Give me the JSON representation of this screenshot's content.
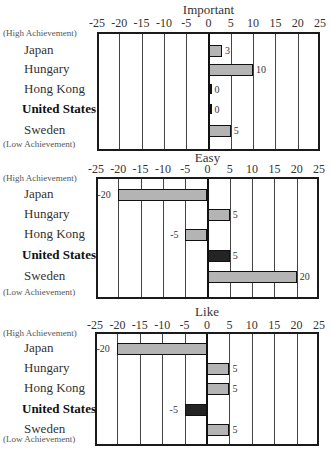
{
  "chart_data": [
    {
      "type": "bar",
      "orientation": "horizontal",
      "title": "Important",
      "categories": [
        "Japan",
        "Hungary",
        "Hong Kong",
        "United States",
        "Sweden"
      ],
      "values": [
        3,
        10,
        0,
        0,
        5
      ],
      "xlim": [
        -25,
        25
      ],
      "xticks": [
        -25,
        -20,
        -15,
        -10,
        -5,
        0,
        5,
        10,
        15,
        20,
        25
      ],
      "grid": true,
      "top_annotation": "(High Achievement)",
      "bottom_annotation": "(Low Achievement)",
      "highlight": "United States"
    },
    {
      "type": "bar",
      "orientation": "horizontal",
      "title": "Easy",
      "categories": [
        "Japan",
        "Hungary",
        "Hong Kong",
        "United States",
        "Sweden"
      ],
      "values": [
        -20,
        5,
        -5,
        5,
        20
      ],
      "xlim": [
        -25,
        25
      ],
      "xticks": [
        -25,
        -20,
        -15,
        -10,
        -5,
        0,
        5,
        10,
        15,
        20,
        25
      ],
      "grid": true,
      "top_annotation": "(High Achievement)",
      "bottom_annotation": "(Low Achievement)",
      "highlight": "United States"
    },
    {
      "type": "bar",
      "orientation": "horizontal",
      "title": "Like",
      "categories": [
        "Japan",
        "Hungary",
        "Hong Kong",
        "United States",
        "Sweden"
      ],
      "values": [
        -20,
        5,
        5,
        -5,
        5
      ],
      "xlim": [
        -25,
        25
      ],
      "xticks": [
        -25,
        -20,
        -15,
        -10,
        -5,
        0,
        5,
        10,
        15,
        20,
        25
      ],
      "grid": true,
      "top_annotation": "(High Achievement)",
      "bottom_annotation": "(Low Achievement)",
      "highlight": "United States"
    }
  ],
  "panels": [
    {
      "title": "Important",
      "high": "(High Achievement)",
      "low": "(Low Achievement)",
      "rows": [
        {
          "label": "Japan",
          "value": 3,
          "value_label": "3"
        },
        {
          "label": "Hungary",
          "value": 10,
          "value_label": "10"
        },
        {
          "label": "Hong Kong",
          "value": 0,
          "value_label": "0"
        },
        {
          "label": "United States",
          "value": 0,
          "value_label": "0"
        },
        {
          "label": "Sweden",
          "value": 5,
          "value_label": "5"
        }
      ]
    },
    {
      "title": "Easy",
      "high": "(High Achievement)",
      "low": "(Low Achievement)",
      "rows": [
        {
          "label": "Japan",
          "value": -20,
          "value_label": "-20"
        },
        {
          "label": "Hungary",
          "value": 5,
          "value_label": "5"
        },
        {
          "label": "Hong Kong",
          "value": -5,
          "value_label": "-5"
        },
        {
          "label": "United States",
          "value": 5,
          "value_label": "5"
        },
        {
          "label": "Sweden",
          "value": 20,
          "value_label": "20"
        }
      ]
    },
    {
      "title": "Like",
      "high": "(High Achievement)",
      "low": "(Low Achievement)",
      "rows": [
        {
          "label": "Japan",
          "value": -20,
          "value_label": "-20"
        },
        {
          "label": "Hungary",
          "value": 5,
          "value_label": "5"
        },
        {
          "label": "Hong Kong",
          "value": 5,
          "value_label": "5"
        },
        {
          "label": "United States",
          "value": -5,
          "value_label": "-5"
        },
        {
          "label": "Sweden",
          "value": 5,
          "value_label": "5"
        }
      ]
    }
  ],
  "ticks": [
    "-25",
    "-20",
    "-15",
    "-10",
    "-5",
    "0",
    "5",
    "10",
    "15",
    "20",
    "25"
  ]
}
